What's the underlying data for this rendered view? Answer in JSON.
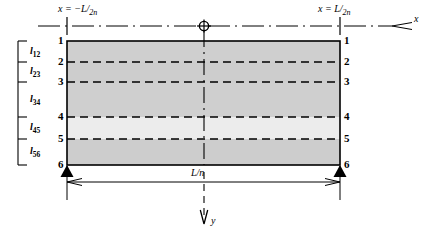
{
  "figure": {
    "type": "engineering-diagram"
  },
  "axes": {
    "x_axis_name": "x",
    "y_axis_name": "y",
    "origin_symbol": "circle-crosshair"
  },
  "station_labels": {
    "left": {
      "prefix": "x = −",
      "numerator": "L",
      "denominator": "2n"
    },
    "right": {
      "prefix": "x = ",
      "numerator": "L",
      "denominator": "2n"
    }
  },
  "nodes": {
    "left": [
      "1",
      "2",
      "3",
      "4",
      "5",
      "6"
    ],
    "right": [
      "1",
      "2",
      "3",
      "4",
      "5",
      "6"
    ]
  },
  "segments": [
    {
      "base": "l",
      "sub": "12"
    },
    {
      "base": "l",
      "sub": "23"
    },
    {
      "base": "l",
      "sub": "34"
    },
    {
      "base": "l",
      "sub": "45"
    },
    {
      "base": "l",
      "sub": "56"
    }
  ],
  "dimension": {
    "span_label": "L/n"
  },
  "colors": {
    "stroke": "#000000",
    "layer_fill": "#cfcfcf",
    "layer_fill_light": "#f2f2f2",
    "background": "#ffffff"
  },
  "geometry": {
    "rect_left": 67,
    "rect_right": 340,
    "node_y": [
      41,
      62,
      82,
      117,
      139,
      165
    ],
    "centerline_x": 204,
    "axis_y": 26
  }
}
